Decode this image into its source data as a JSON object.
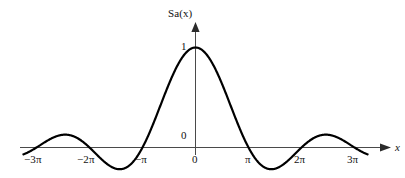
{
  "figure": {
    "name": "sinc-function-plot",
    "background_color": "#ffffff",
    "curve_color": "#000000",
    "axis_color": "#4a4a4a"
  },
  "axes": {
    "y_axis_title": "Sa(x)",
    "y_axis_title_base": "Sa(",
    "y_axis_title_var": "x",
    "y_axis_title_close": ")",
    "x_axis_title": "x",
    "y_origin_label": "0",
    "y_max_label": "1"
  },
  "x_ticks": [
    {
      "label": "−3π",
      "value": -9.42478,
      "px": 36
    },
    {
      "label": "−2π",
      "value": -6.28319,
      "px": 89
    },
    {
      "label": "−π",
      "value": -3.14159,
      "px": 142
    },
    {
      "label": "0",
      "value": 0,
      "px": 195
    },
    {
      "label": "π",
      "value": 3.14159,
      "px": 248
    },
    {
      "label": "2π",
      "value": 6.28319,
      "px": 301
    },
    {
      "label": "3π",
      "value": 9.42478,
      "px": 354
    }
  ],
  "chart_data": {
    "type": "line",
    "title": "",
    "xlabel": "x",
    "ylabel": "Sa(x)",
    "function": "Sa(x) = sin(x)/x",
    "xlim": [
      -10.2,
      10.2
    ],
    "ylim": [
      -0.28,
      1.12
    ],
    "grid": false,
    "legend": null,
    "x_tick_labels": [
      "−3π",
      "−2π",
      "−π",
      "0",
      "π",
      "2π",
      "3π"
    ],
    "x_tick_values": [
      -9.42478,
      -6.28319,
      -3.14159,
      0,
      3.14159,
      6.28319,
      9.42478
    ],
    "y_tick_labels": [
      "0",
      "1"
    ],
    "y_tick_values": [
      0,
      1
    ],
    "annotations": [],
    "series": [
      {
        "name": "Sa(x)",
        "x": [
          -10.2,
          -9.9,
          -9.6,
          -9.42478,
          -9.1,
          -8.8,
          -8.5,
          -8.2,
          -7.9,
          -7.85,
          -7.6,
          -7.3,
          -7.0,
          -6.7,
          -6.4,
          -6.28319,
          -6.0,
          -5.7,
          -5.4,
          -5.1,
          -4.8,
          -4.49,
          -4.2,
          -3.9,
          -3.6,
          -3.3,
          -3.14159,
          -2.9,
          -2.6,
          -2.3,
          -2.0,
          -1.7,
          -1.4,
          -1.1,
          -0.8,
          -0.5,
          -0.2,
          0,
          0.2,
          0.5,
          0.8,
          1.1,
          1.4,
          1.7,
          2.0,
          2.3,
          2.6,
          2.9,
          3.14159,
          3.3,
          3.6,
          3.9,
          4.2,
          4.49,
          4.8,
          5.1,
          5.4,
          5.7,
          6.0,
          6.28319,
          6.4,
          6.7,
          7.0,
          7.3,
          7.6,
          7.85,
          7.9,
          8.2,
          8.5,
          8.8,
          9.1,
          9.42478,
          9.6,
          9.9,
          10.2
        ],
        "y": [
          -0.0846,
          -0.0464,
          -0.0186,
          0.0,
          0.0332,
          0.0583,
          0.0754,
          0.0845,
          0.0861,
          0.0858,
          0.0805,
          0.0678,
          0.0939,
          0.0572,
          0.0242,
          0.0,
          -0.0466,
          -0.0906,
          -0.1277,
          -0.1546,
          -0.1689,
          -0.2172,
          -0.2075,
          -0.178,
          -0.1228,
          -0.047,
          0.0,
          0.0826,
          0.1969,
          0.3238,
          0.4546,
          0.5827,
          0.704,
          0.8105,
          0.8967,
          0.9589,
          0.9934,
          1.0,
          0.9934,
          0.9589,
          0.8967,
          0.8105,
          0.704,
          0.5827,
          0.4546,
          0.3238,
          0.1969,
          0.0826,
          0.0,
          -0.047,
          -0.1228,
          -0.178,
          -0.2075,
          -0.2172,
          -0.1689,
          -0.1546,
          -0.1277,
          -0.0906,
          -0.0466,
          0.0,
          0.0242,
          0.0572,
          0.0939,
          0.0678,
          0.0805,
          0.0858,
          0.0861,
          0.0845,
          0.0754,
          0.0583,
          0.0332,
          0.0,
          -0.0186,
          -0.0464,
          -0.0846
        ]
      }
    ]
  }
}
